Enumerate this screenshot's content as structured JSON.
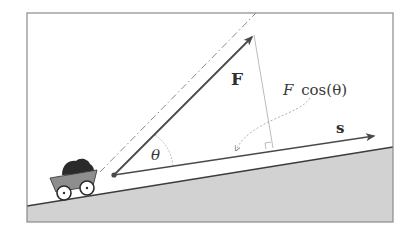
{
  "diagram": {
    "labels": {
      "force": "F",
      "displacement": "s",
      "angle": "θ",
      "projection_var": "F",
      "projection_func": "cos(θ)"
    },
    "colors": {
      "frame": "#8a8a8a",
      "background": "#ffffff",
      "ground_fill": "#d2d2d2",
      "ground_line": "#3c3c3c",
      "vector": "#4a4a4a",
      "guide": "#9a9a9a",
      "cart_body": "#8e8e8e",
      "coal": "#2a2a2a",
      "wheel": "#ffffff"
    }
  }
}
